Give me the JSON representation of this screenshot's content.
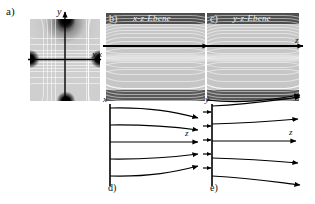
{
  "figure": {
    "panels": [
      {
        "tag": "a)",
        "title": "",
        "type": "quadrupole-cross-section",
        "axes": {
          "horizontal": "x",
          "vertical": "y"
        }
      },
      {
        "tag": "b)",
        "title": "x-z-Ebene",
        "type": "grayscale-field-map",
        "axes": {
          "vertical": "x"
        }
      },
      {
        "tag": "c)",
        "title": "y-z-Ebene",
        "type": "grayscale-field-map",
        "axes": {
          "horizontal": "z"
        }
      },
      {
        "tag": "d)",
        "title": "",
        "type": "field-line-schematic",
        "axes": {
          "vertical": "x",
          "horizontal": "z"
        },
        "arrow_count": 5
      },
      {
        "tag": "e)",
        "title": "",
        "type": "field-line-schematic",
        "axes": {
          "vertical": "y",
          "horizontal": "z"
        },
        "arrow_count": 5
      }
    ],
    "axis_labels": {
      "a_x": "x",
      "a_y": "y",
      "b_x": "x",
      "c_z": "z",
      "d_x": "x",
      "d_z": "z",
      "e_y": "y",
      "e_z": "z"
    },
    "colors": {
      "background": "#ffffff",
      "ink": "#111111",
      "map_mid": "#c2c2c2",
      "map_dark": "#5a5a5a",
      "title_text": "#f0f0f0"
    }
  }
}
